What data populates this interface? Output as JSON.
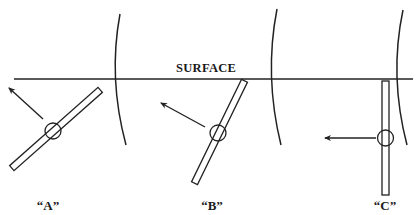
{
  "diagram": {
    "type": "physics illustration",
    "surface_label": "SURFACE",
    "colors": {
      "ink": "#222222",
      "background": "#ffffff"
    },
    "configurations": [
      {
        "id": "A",
        "label": "“A”",
        "orientation": "tilted ~40 degrees from horizontal",
        "arrow_direction": "up-left"
      },
      {
        "id": "B",
        "label": "“B”",
        "orientation": "tilted ~64 degrees from horizontal, touching surface",
        "arrow_direction": "up-left"
      },
      {
        "id": "C",
        "label": "“C”",
        "orientation": "vertical, hanging from surface",
        "arrow_direction": "left"
      }
    ],
    "wavefront_arcs": 3
  }
}
